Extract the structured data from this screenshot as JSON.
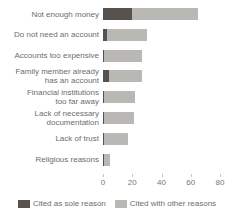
{
  "chart_data": {
    "type": "bar",
    "orientation": "horizontal",
    "stacked": true,
    "unit": "percent",
    "categories": [
      "Not enough money",
      "Do not need an account",
      "Accounts too expensive",
      "Family member already has an account",
      "Financial institutions too far away",
      "Lack of necessary documentation",
      "Lack of trust",
      "Religious reasons"
    ],
    "category_lines": [
      [
        "Not enough money"
      ],
      [
        "Do not need an account"
      ],
      [
        "Accounts too expensive"
      ],
      [
        "Family member already",
        "has an account"
      ],
      [
        "Financial institutions",
        "too far away"
      ],
      [
        "Lack of necessary",
        "documentation"
      ],
      [
        "Lack of trust"
      ],
      [
        "Religious reasons"
      ]
    ],
    "series": [
      {
        "name": "Cited as sole reason",
        "color": "#57524d",
        "values": [
          20,
          3,
          1,
          4,
          1,
          1,
          1,
          1
        ]
      },
      {
        "name": "Cited with other reasons",
        "color": "#b9b8b4",
        "values": [
          45,
          27,
          26,
          23,
          21,
          20,
          16,
          4
        ]
      }
    ],
    "totals": [
      65,
      30,
      27,
      27,
      22,
      21,
      17,
      5
    ],
    "xlim": [
      0,
      89
    ],
    "x_ticks": [
      0,
      20,
      40,
      60,
      80
    ],
    "grid": false,
    "legend_position": "bottom",
    "title": "",
    "xlabel": "",
    "ylabel": ""
  },
  "style": {
    "label_color": "#6d6d6d",
    "axis_text_color": "#767676",
    "tick_color": "#c4c4c4",
    "background": "#ffffff"
  }
}
